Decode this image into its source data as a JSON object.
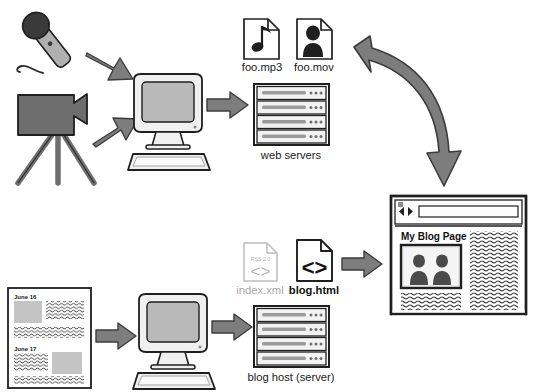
{
  "diagram": {
    "background": "#ffffff",
    "colors": {
      "arrow_fill": "#7d7d7d",
      "arrow_stroke": "#3c3c3c",
      "device_fill": "#6e6e6e",
      "device_dark": "#3a3a3a",
      "screen_fill": "#b9b9b9",
      "outline": "#1f1f1f",
      "grey_text": "#a8a8a8",
      "server_bar": "#9a9a9a",
      "thumb_fill": "#c4c4c4"
    }
  },
  "nodes": {
    "microphone": {
      "name": "microphone",
      "label": ""
    },
    "video_camera": {
      "name": "video-camera-tripod",
      "label": ""
    },
    "encoding_computer": {
      "name": "encoding-computer",
      "label": ""
    },
    "media_files": [
      {
        "label": "foo.mp3",
        "icon": "music-note-file-icon",
        "style": "black"
      },
      {
        "label": "foo.mov",
        "icon": "video-person-file-icon",
        "style": "black"
      }
    ],
    "web_servers": {
      "label": "web servers",
      "icon": "server-rack-icon",
      "units": 4,
      "dots_per_unit": 3
    },
    "blog_documents": {
      "entries": [
        {
          "date": "June 16",
          "image_side": "left"
        },
        {
          "date": "June 17",
          "image_side": "right"
        }
      ]
    },
    "blog_computer": {
      "name": "blog-authoring-computer",
      "label": ""
    },
    "generated_files": [
      {
        "label": "index.xml",
        "icon": "rss-xml-file-icon",
        "badge": "RSS 2.0",
        "glyph": "<>",
        "style": "grey"
      },
      {
        "label": "blog.html",
        "icon": "html-file-icon",
        "badge": "",
        "glyph": "<>",
        "style": "black"
      }
    ],
    "blog_host": {
      "label": "blog host (server)",
      "icon": "server-rack-icon",
      "units": 4,
      "dots_per_unit": 3
    },
    "browser": {
      "name": "browser-window",
      "address_bar_value": "",
      "page_title": "My Blog Page",
      "photo_alt": "two-people-photo",
      "back_icon": "back-arrow-icon",
      "forward_icon": "forward-arrow-icon"
    }
  },
  "arrows": [
    {
      "name": "arrow-mic-to-computer",
      "kind": "straight"
    },
    {
      "name": "arrow-camera-to-computer",
      "kind": "straight"
    },
    {
      "name": "arrow-computer-to-web-servers",
      "kind": "straight"
    },
    {
      "name": "arrow-web-servers-to-browser",
      "kind": "curved"
    },
    {
      "name": "arrow-documents-to-blog-computer",
      "kind": "straight"
    },
    {
      "name": "arrow-blog-computer-to-blog-host",
      "kind": "straight"
    },
    {
      "name": "arrow-blog-html-to-browser",
      "kind": "straight"
    }
  ]
}
